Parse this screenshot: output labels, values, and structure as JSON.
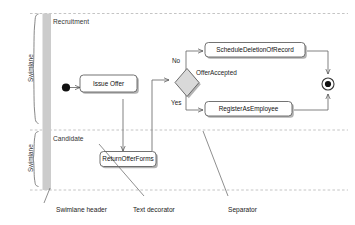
{
  "diagram": {
    "type": "uml-activity-diagram",
    "colors": {
      "stroke": "#4a4a4a",
      "node_fill": "#ffffff",
      "decision_fill": "#d9d9d9",
      "header_band": "#cccccc",
      "separator": "#b9b9b9",
      "shadow": "#b0b0b0",
      "text": "#222222"
    },
    "swimlanes": [
      {
        "id": "recruitment",
        "name": "Recruitment",
        "bracket_label": "Swimlane"
      },
      {
        "id": "candidate",
        "name": "Candidate",
        "bracket_label": "Swimlane"
      }
    ],
    "nodes": [
      {
        "id": "initial",
        "kind": "initial-node",
        "label": ""
      },
      {
        "id": "issue-offer",
        "kind": "action",
        "label": "Issue Offer"
      },
      {
        "id": "return-offer-forms",
        "kind": "action",
        "label": "ReturnOfferForms"
      },
      {
        "id": "offer-accepted",
        "kind": "decision",
        "label": "OfferAccepted"
      },
      {
        "id": "schedule-deletion",
        "kind": "action",
        "label": "ScheduleDeletionOfRecord"
      },
      {
        "id": "register-employee",
        "kind": "action",
        "label": "RegisterAsEmployee"
      },
      {
        "id": "final",
        "kind": "final-node",
        "label": ""
      }
    ],
    "edge_labels": {
      "no": "No",
      "yes": "Yes"
    },
    "annotations": [
      {
        "id": "swimlane-header",
        "label": "Swimlane header"
      },
      {
        "id": "text-decorator",
        "label": "Text decorator"
      },
      {
        "id": "separator",
        "label": "Separator"
      }
    ]
  }
}
